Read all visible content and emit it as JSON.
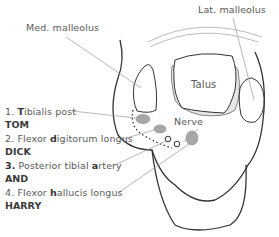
{
  "labels": {
    "med_malleolus": "Med. malleolus",
    "lat_malleolus": "Lat. malleolus",
    "talus": "Talus",
    "nerve": "Nerve"
  },
  "structures": [
    {
      "num": "1.",
      "bold_letter": "T",
      "rest": "ibialis post",
      "mnemonic": "TOM"
    },
    {
      "num": "2.",
      "pre": "Flexor ",
      "bold_letter": "d",
      "rest": "igitorum longus",
      "mnemonic": "DICK"
    },
    {
      "num": "3.",
      "pre": "Posterior tibial ",
      "bold_letter": "a",
      "rest": "rtery",
      "mnemonic": "AND"
    },
    {
      "num": "4.",
      "pre": "Flexor ",
      "bold_letter": "h",
      "rest": "allucis longus",
      "mnemonic": "HARRY"
    }
  ],
  "colors": {
    "outline": "#333333",
    "leader": "#9a9a9a",
    "fill_grey": "#a8a8a8",
    "fill_light": "#e6e6e6"
  }
}
